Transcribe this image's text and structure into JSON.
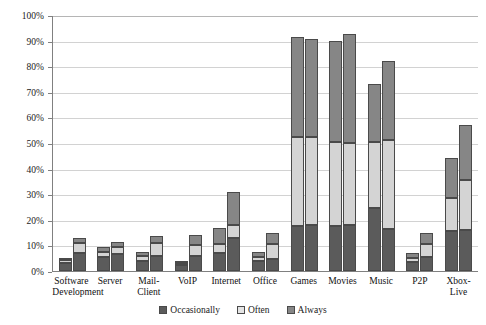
{
  "chart_data": {
    "type": "bar",
    "subtype": "stacked-grouped-column",
    "title": "",
    "xlabel": "",
    "ylabel": "",
    "ylim": [
      0,
      100
    ],
    "ytick_labels": [
      "100%",
      "90%",
      "80%",
      "70%",
      "60%",
      "50%",
      "40%",
      "30%",
      "20%",
      "10%",
      "0%"
    ],
    "ytick_values": [
      100,
      90,
      80,
      70,
      60,
      50,
      40,
      30,
      20,
      10,
      0
    ],
    "grid": true,
    "legend_position": "bottom",
    "legend": [
      "Occasionally",
      "Often",
      "Always"
    ],
    "series_colors": [
      "#5b5b5b",
      "#d4d4d4",
      "#868686"
    ],
    "categories": [
      "Software Development",
      "Server",
      "Mail-Client",
      "VoIP",
      "Internet",
      "Office",
      "Games",
      "Movies",
      "Music",
      "P2P",
      "Xbox-Live"
    ],
    "bars_per_category": 2,
    "bar_group_names": [
      "Bar 1",
      "Bar 2"
    ],
    "series": [
      {
        "name": "Occasionally",
        "values_bar1": [
          3.5,
          5.5,
          4.0,
          2.5,
          7.0,
          4.0,
          17.5,
          17.5,
          24.5,
          3.5,
          15.5
        ],
        "values_bar2": [
          7.0,
          6.5,
          6.0,
          6.0,
          13.0,
          4.5,
          18.0,
          18.0,
          16.5,
          5.5,
          16.0
        ]
      },
      {
        "name": "Often",
        "values_bar1": [
          1.0,
          2.0,
          2.0,
          1.0,
          3.5,
          1.5,
          35.0,
          33.0,
          26.0,
          1.5,
          13.0
        ],
        "values_bar2": [
          4.0,
          3.0,
          5.0,
          4.0,
          5.0,
          6.0,
          34.5,
          32.0,
          34.5,
          5.0,
          19.5
        ]
      },
      {
        "name": "Always",
        "values_bar1": [
          0.5,
          2.0,
          1.5,
          0.5,
          6.5,
          2.0,
          39.0,
          39.5,
          22.5,
          2.0,
          15.5
        ],
        "values_bar2": [
          2.0,
          2.0,
          2.5,
          4.0,
          13.0,
          4.5,
          38.0,
          42.5,
          31.0,
          4.5,
          21.5
        ]
      }
    ],
    "totals_bar1": [
      5.0,
      9.5,
      7.5,
      4.0,
      17.0,
      7.5,
      91.5,
      90.0,
      73.0,
      7.0,
      44.0
    ],
    "totals_bar2": [
      13.0,
      11.5,
      13.5,
      14.0,
      31.0,
      15.0,
      92.0,
      93.0,
      82.0,
      15.0,
      57.0
    ]
  }
}
